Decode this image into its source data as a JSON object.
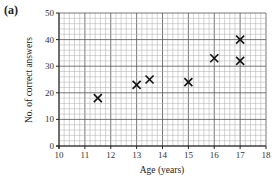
{
  "figure_label": "(a)",
  "chart_data": {
    "type": "scatter",
    "title": "",
    "xlabel": "Age (years)",
    "ylabel": "No. of correct answers",
    "xlim": [
      10,
      18
    ],
    "ylim": [
      0,
      50
    ],
    "xticks": [
      10,
      11,
      12,
      13,
      14,
      15,
      16,
      17,
      18
    ],
    "yticks": [
      0,
      10,
      20,
      30,
      40,
      50
    ],
    "grid": true,
    "marker": "x",
    "points": [
      {
        "x": 11.5,
        "y": 18
      },
      {
        "x": 13,
        "y": 23
      },
      {
        "x": 13.5,
        "y": 25
      },
      {
        "x": 15,
        "y": 24
      },
      {
        "x": 16,
        "y": 33
      },
      {
        "x": 17,
        "y": 40
      },
      {
        "x": 17,
        "y": 32
      }
    ]
  }
}
